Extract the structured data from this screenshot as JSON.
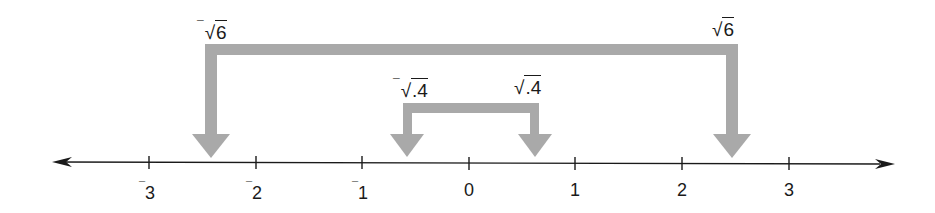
{
  "diagram": {
    "colors": {
      "axis": "#1a1a1a",
      "bracket": "#a9a9a9",
      "text": "#1a1a1a",
      "background": "#ffffff"
    },
    "number_line": {
      "min_visible": -3.8,
      "max_visible": 3.8,
      "ticks": [
        {
          "value": -3,
          "neg": true,
          "digit": "3"
        },
        {
          "value": -2,
          "neg": true,
          "digit": "2"
        },
        {
          "value": -1,
          "neg": true,
          "digit": "1"
        },
        {
          "value": 0,
          "neg": false,
          "digit": "0"
        },
        {
          "value": 1,
          "neg": false,
          "digit": "1"
        },
        {
          "value": 2,
          "neg": false,
          "digit": "2"
        },
        {
          "value": 3,
          "neg": false,
          "digit": "3"
        }
      ],
      "arrows": [
        "left",
        "right"
      ]
    },
    "brackets": [
      {
        "name": "outer",
        "left_label": {
          "neg": "¯",
          "radical": "√",
          "arg": "6"
        },
        "right_label": {
          "neg": "",
          "radical": "√",
          "arg": "6"
        },
        "left_value": -2.449,
        "right_value": 2.449
      },
      {
        "name": "inner",
        "left_label": {
          "neg": "¯",
          "radical": "√",
          "arg": ".4"
        },
        "right_label": {
          "neg": "",
          "radical": "√",
          "arg": ".4"
        },
        "left_value": -0.632,
        "right_value": 0.632
      }
    ]
  }
}
